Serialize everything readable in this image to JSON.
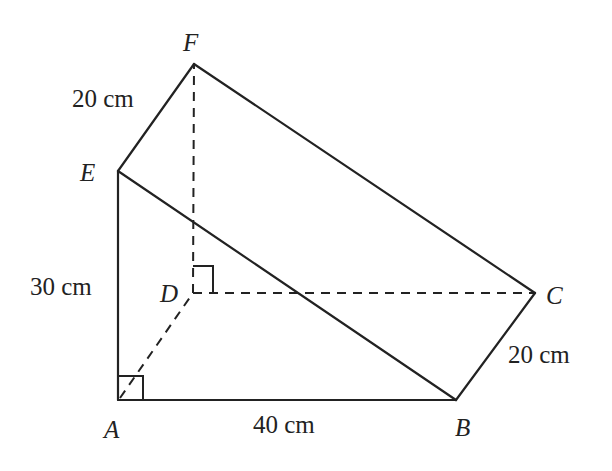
{
  "diagram": {
    "vertices": {
      "A": {
        "label": "A",
        "x": 118,
        "y": 400
      },
      "B": {
        "label": "B",
        "x": 456,
        "y": 400
      },
      "C": {
        "label": "C",
        "x": 535,
        "y": 293
      },
      "D": {
        "label": "D",
        "x": 193,
        "y": 293
      },
      "E": {
        "label": "E",
        "x": 118,
        "y": 171
      },
      "F": {
        "label": "F",
        "x": 194,
        "y": 64
      }
    },
    "edges": {
      "solid": [
        [
          "A",
          "B"
        ],
        [
          "A",
          "E"
        ],
        [
          "E",
          "B"
        ],
        [
          "B",
          "C"
        ],
        [
          "E",
          "F"
        ],
        [
          "F",
          "C"
        ]
      ],
      "hidden": [
        [
          "A",
          "D"
        ],
        [
          "D",
          "C"
        ],
        [
          "D",
          "F"
        ]
      ]
    },
    "right_angles": [
      "A",
      "D"
    ],
    "measurements": {
      "EF": "20 cm",
      "AE": "30 cm",
      "AB": "40 cm",
      "BC": "20 cm"
    }
  }
}
